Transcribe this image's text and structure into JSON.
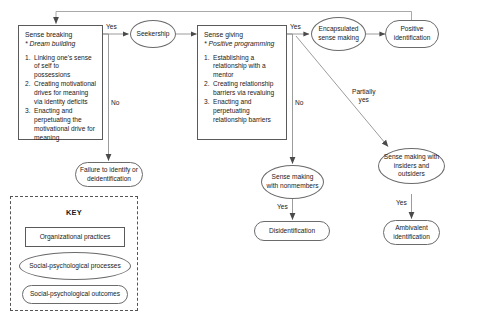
{
  "figure": {
    "type": "process-flowchart",
    "title_fragment": ""
  },
  "nodes": {
    "sense_breaking": {
      "shape": "rect",
      "category": "Organizational practices",
      "title": "Sense breaking",
      "subtitle": "* Dream building",
      "items": [
        {
          "num": "1.",
          "text": "Linking one's sense of self to possessions"
        },
        {
          "num": "2.",
          "text": "Creating motivational drives for meaning via identity deficits"
        },
        {
          "num": "3.",
          "text": "Enacting and perpetuating the motivational drive for meaning"
        }
      ]
    },
    "sense_giving": {
      "shape": "rect",
      "category": "Organizational practices",
      "title": "Sense giving",
      "subtitle": "* Positive programming",
      "items": [
        {
          "num": "1.",
          "text": "Establishing a relationship with a mentor"
        },
        {
          "num": "2.",
          "text": "Creating relationship barriers via revaluing"
        },
        {
          "num": "3.",
          "text": "Enacting and perpetuating relationship barriers"
        }
      ]
    },
    "seekership": {
      "shape": "ellipse",
      "category": "Social-psychological processes",
      "label": "Seekership"
    },
    "encapsulated_sense_making": {
      "shape": "ellipse",
      "category": "Social-psychological processes",
      "label": "Encapsulated sense making"
    },
    "sense_making_nonmembers": {
      "shape": "ellipse",
      "category": "Social-psychological processes",
      "label": "Sense making with nonmembers"
    },
    "sense_making_insiders_outsiders": {
      "shape": "ellipse",
      "category": "Social-psychological processes",
      "label": "Sense making with insiders and outsiders"
    },
    "positive_identification": {
      "shape": "stadium",
      "category": "Social-psychological outcomes",
      "label": "Positive identification"
    },
    "failure_to_identify": {
      "shape": "stadium",
      "category": "Social-psychological outcomes",
      "label": "Failure to identify or deidentification"
    },
    "disidentification": {
      "shape": "stadium",
      "category": "Social-psychological outcomes",
      "label": "Disidentification"
    },
    "ambivalent_identification": {
      "shape": "stadium",
      "category": "Social-psychological outcomes",
      "label": "Ambivalent identification"
    }
  },
  "edge_labels": {
    "breaking_yes": "Yes",
    "breaking_no": "No",
    "giving_yes": "Yes",
    "giving_no": "No",
    "partially_yes": "Partially\nyes",
    "nonmembers_yes": "Yes",
    "insiders_yes": "Yes"
  },
  "key": {
    "title": "KEY",
    "items": [
      {
        "shape": "rect",
        "label": "Organizational practices"
      },
      {
        "shape": "ellipse",
        "label": "Social-psychological processes"
      },
      {
        "shape": "stadium",
        "label": "Social-psychological outcomes"
      }
    ]
  },
  "colors": {
    "line": "#6b6b6b",
    "box_border": "#5a5a5a",
    "key_border": "#555555",
    "text": "#1a1a1a",
    "background": "#ffffff"
  }
}
